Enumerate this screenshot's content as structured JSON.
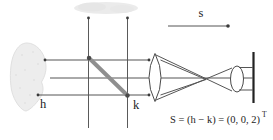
{
  "figure": {
    "type": "scanned-optics-diffraction-diagram",
    "label_h": "h",
    "label_k": "k",
    "label_s": "s",
    "formula": {
      "main": "S = (h − k) = (0, 0, 2)",
      "superscript": "T"
    },
    "colors": {
      "background": "#ffffff",
      "line": "#4f4f4f",
      "beam_splitter_gray": "#8f8f8f",
      "dot": "#3a3a3a",
      "specimen_fill": "#ededed",
      "specimen_edge": "#e0e0e0",
      "smudge_fill": "#ebebeb",
      "text": "#1c1c1c"
    }
  }
}
